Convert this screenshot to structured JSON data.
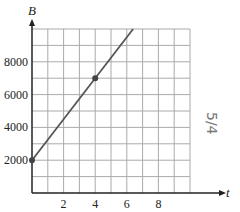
{
  "chart_data": {
    "type": "line",
    "title": "",
    "xlabel": "t",
    "ylabel": "B",
    "xlim": [
      0,
      10
    ],
    "ylim": [
      0,
      10000
    ],
    "x_ticks": [
      2,
      4,
      6,
      8
    ],
    "y_ticks": [
      2000,
      4000,
      6000,
      8000
    ],
    "x_tick_labels": [
      "2",
      "4",
      "6",
      "8"
    ],
    "y_tick_labels": [
      "2000",
      "4000",
      "6000",
      "8000"
    ],
    "grid": true,
    "grid_step_x": 1,
    "grid_step_y": 1000,
    "series": [
      {
        "name": "B(t)",
        "x": [
          0,
          6.4
        ],
        "y": [
          2000,
          10000
        ],
        "color": "#555555"
      }
    ],
    "points": [
      {
        "x": 0,
        "y": 2000
      },
      {
        "x": 4,
        "y": 7000
      }
    ],
    "annotations": [
      {
        "text": "5/4",
        "note": "handwritten, rotated, right margin"
      }
    ]
  }
}
